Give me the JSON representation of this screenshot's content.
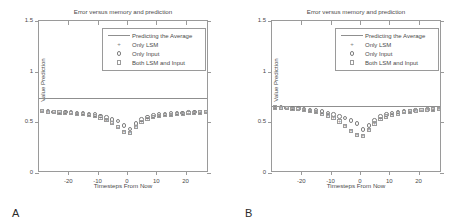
{
  "figure": {
    "panels": [
      {
        "letter": "A",
        "chart_data": {
          "type": "scatter",
          "title": "Error versus memory and prediction",
          "xlabel": "Timesteps From Now",
          "ylabel": "Value Prediction",
          "xlim": [
            -30,
            28
          ],
          "ylim": [
            0,
            1.5
          ],
          "xticks": [
            -20,
            -10,
            0,
            10,
            20
          ],
          "xticklabels": [
            "-20",
            "-10",
            "0",
            "10",
            "20"
          ],
          "yticks": [
            0,
            0.5,
            1,
            1.5
          ],
          "yticklabels": [
            "0",
            "0.5",
            "1",
            "1.5"
          ],
          "grid": false,
          "legend_position": "top-right-inside",
          "legend": [
            {
              "label": "Predicting the Average",
              "marker": "line"
            },
            {
              "label": "Only LSM",
              "marker": "plus"
            },
            {
              "label": "Only Input",
              "marker": "circle"
            },
            {
              "label": "Both LSM and Input",
              "marker": "square"
            }
          ],
          "annotations": [
            {
              "name": "average-baseline",
              "type": "hline",
              "y": 0.745,
              "label": "Predicting the Average"
            }
          ],
          "x": [
            -29,
            -27,
            -25,
            -23,
            -21,
            -19,
            -17,
            -15,
            -13,
            -11,
            -9,
            -7,
            -5,
            -3,
            -1,
            1,
            3,
            5,
            7,
            9,
            11,
            13,
            15,
            17,
            19,
            21,
            23,
            25,
            27
          ],
          "series": [
            {
              "name": "Only LSM",
              "marker": "plus",
              "values": [
                0.61,
                0.605,
                0.6,
                0.598,
                0.595,
                0.59,
                0.585,
                0.578,
                0.57,
                0.56,
                0.545,
                0.52,
                0.49,
                0.45,
                0.405,
                0.4,
                0.455,
                0.505,
                0.535,
                0.552,
                0.565,
                0.572,
                0.578,
                0.582,
                0.586,
                0.59,
                0.594,
                0.598,
                0.6
              ]
            },
            {
              "name": "Only Input",
              "marker": "circle",
              "values": [
                0.612,
                0.608,
                0.604,
                0.602,
                0.6,
                0.597,
                0.594,
                0.59,
                0.585,
                0.578,
                0.565,
                0.548,
                0.528,
                0.512,
                0.47,
                0.432,
                0.488,
                0.528,
                0.552,
                0.566,
                0.576,
                0.582,
                0.586,
                0.59,
                0.594,
                0.597,
                0.6,
                0.603,
                0.605
              ]
            },
            {
              "name": "Both LSM and Input",
              "marker": "square",
              "values": [
                0.608,
                0.604,
                0.6,
                0.597,
                0.594,
                0.59,
                0.586,
                0.58,
                0.572,
                0.562,
                0.548,
                0.524,
                0.492,
                0.452,
                0.404,
                0.398,
                0.452,
                0.502,
                0.532,
                0.55,
                0.562,
                0.57,
                0.576,
                0.581,
                0.585,
                0.589,
                0.593,
                0.597,
                0.6
              ]
            }
          ]
        }
      },
      {
        "letter": "B",
        "chart_data": {
          "type": "scatter",
          "title": "Error versus memory and prediction",
          "xlabel": "Timesteps From Now",
          "ylabel": "Value Prediction",
          "xlim": [
            -30,
            28
          ],
          "ylim": [
            0,
            1.5
          ],
          "xticks": [
            -20,
            -10,
            0,
            10,
            20
          ],
          "xticklabels": [
            "-20",
            "-10",
            "0",
            "10",
            "20"
          ],
          "yticks": [
            0,
            0.5,
            1,
            1.5
          ],
          "yticklabels": [
            "0",
            "0.5",
            "1",
            "1.5"
          ],
          "grid": false,
          "legend_position": "top-right-inside",
          "legend": [
            {
              "label": "Predicting the Average",
              "marker": "line"
            },
            {
              "label": "Only LSM",
              "marker": "plus"
            },
            {
              "label": "Only Input",
              "marker": "circle"
            },
            {
              "label": "Both LSM and Input",
              "marker": "square"
            }
          ],
          "annotations": [
            {
              "name": "average-baseline",
              "type": "hline",
              "y": 0.66,
              "label": "Predicting the Average"
            }
          ],
          "x": [
            -29,
            -27,
            -25,
            -23,
            -21,
            -19,
            -17,
            -15,
            -13,
            -11,
            -9,
            -7,
            -5,
            -3,
            -1,
            1,
            3,
            5,
            7,
            9,
            11,
            13,
            15,
            17,
            19,
            21,
            23,
            25,
            27
          ],
          "series": [
            {
              "name": "Only LSM",
              "marker": "plus",
              "values": [
                0.648,
                0.644,
                0.64,
                0.636,
                0.63,
                0.622,
                0.614,
                0.602,
                0.588,
                0.57,
                0.545,
                0.512,
                0.468,
                0.42,
                0.378,
                0.372,
                0.432,
                0.492,
                0.534,
                0.56,
                0.578,
                0.59,
                0.6,
                0.608,
                0.614,
                0.62,
                0.624,
                0.628,
                0.632
              ]
            },
            {
              "name": "Only Input",
              "marker": "circle",
              "values": [
                0.652,
                0.648,
                0.644,
                0.64,
                0.636,
                0.63,
                0.624,
                0.616,
                0.606,
                0.594,
                0.578,
                0.558,
                0.54,
                0.52,
                0.49,
                0.428,
                0.468,
                0.52,
                0.558,
                0.578,
                0.592,
                0.6,
                0.608,
                0.614,
                0.618,
                0.622,
                0.626,
                0.63,
                0.634
              ]
            },
            {
              "name": "Both LSM and Input",
              "marker": "square",
              "values": [
                0.646,
                0.642,
                0.638,
                0.634,
                0.628,
                0.62,
                0.612,
                0.6,
                0.586,
                0.568,
                0.542,
                0.508,
                0.464,
                0.416,
                0.374,
                0.368,
                0.428,
                0.488,
                0.53,
                0.558,
                0.576,
                0.588,
                0.598,
                0.606,
                0.612,
                0.618,
                0.622,
                0.626,
                0.63
              ]
            }
          ]
        }
      }
    ]
  }
}
